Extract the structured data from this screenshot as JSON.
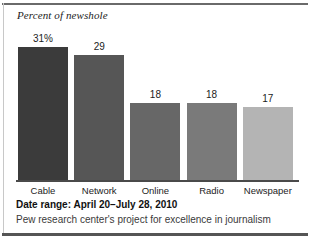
{
  "chart_data": {
    "type": "bar",
    "title": "Percent of newshole",
    "subtitle": "",
    "xlabel": "",
    "ylabel": "Percent of newshole",
    "categories": [
      "Cable",
      "Network",
      "Online",
      "Radio",
      "Newspaper"
    ],
    "values": [
      31,
      29,
      18,
      18,
      17
    ],
    "value_labels": [
      "31%",
      "29",
      "18",
      "18",
      "17"
    ],
    "ylim": [
      0,
      34
    ],
    "grid": false,
    "legend": "none",
    "bar_colors": [
      "#3b3b3b",
      "#565656",
      "#676767",
      "#7a7a7a",
      "#b4b4b4"
    ],
    "axis_color": "#4a4a4a"
  },
  "footer": {
    "date_range": "Date range: April 20–July 28, 2010",
    "source": "Pew research center's project for excellence in journalism"
  },
  "frame": {
    "top_rule_color": "#6a6a6a",
    "bottom_rule_color": "#555555"
  }
}
